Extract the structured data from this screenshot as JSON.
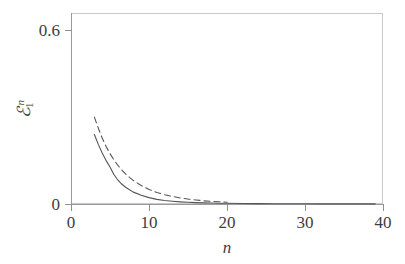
{
  "chart_data": {
    "type": "line",
    "title": "",
    "subtitle": "",
    "xlabel": "n",
    "ylabel": "E_1^n",
    "ylabel_parts": {
      "symbol": "ℰ",
      "subscript": "1",
      "superscript": "n"
    },
    "xlim": [
      0,
      40
    ],
    "ylim": [
      0,
      0.66
    ],
    "xticks": [
      0,
      10,
      20,
      30,
      40
    ],
    "xticklabels": [
      "0",
      "10",
      "20",
      "30",
      "40"
    ],
    "yticks": [
      0,
      0.6
    ],
    "yticklabels": [
      "0",
      "0.6"
    ],
    "grid": false,
    "legend": "none",
    "frame": "box",
    "series": [
      {
        "name": "dashed-curve",
        "style": "dashed",
        "color": "#555555",
        "x": [
          3,
          3.5,
          4,
          4.5,
          5,
          5.5,
          6,
          6.5,
          7,
          7.5,
          8,
          9,
          10,
          11,
          12,
          13,
          14,
          15,
          16,
          17,
          18,
          19,
          20
        ],
        "y": [
          0.3,
          0.262,
          0.228,
          0.199,
          0.174,
          0.153,
          0.134,
          0.118,
          0.104,
          0.092,
          0.081,
          0.064,
          0.05,
          0.04,
          0.032,
          0.026,
          0.021,
          0.017,
          0.014,
          0.011,
          0.009,
          0.008,
          0.006
        ]
      },
      {
        "name": "solid-curve",
        "style": "solid",
        "color": "#555555",
        "x": [
          3,
          3.5,
          4,
          4.5,
          5,
          5.5,
          6,
          6.5,
          7,
          7.5,
          8,
          9,
          10,
          11,
          12,
          13,
          14,
          15,
          16,
          17,
          18,
          19,
          20,
          22,
          24,
          26,
          28,
          30,
          32,
          34,
          36,
          38,
          39
        ],
        "y": [
          0.24,
          0.206,
          0.176,
          0.15,
          0.128,
          0.102,
          0.083,
          0.069,
          0.058,
          0.049,
          0.041,
          0.03,
          0.022,
          0.016,
          0.012,
          0.0095,
          0.0075,
          0.006,
          0.0048,
          0.004,
          0.0033,
          0.0028,
          0.0024,
          0.0018,
          0.0014,
          0.0011,
          0.0009,
          0.0007,
          0.0006,
          0.0005,
          0.0004,
          0.0003,
          0.0003
        ]
      }
    ],
    "annotations": []
  },
  "axes": {
    "y_ticks": [
      {
        "label": "0.6",
        "value": 0.6
      },
      {
        "label": "0",
        "value": 0
      }
    ],
    "x_ticks": [
      {
        "label": "0",
        "value": 0
      },
      {
        "label": "10",
        "value": 10
      },
      {
        "label": "20",
        "value": 20
      },
      {
        "label": "30",
        "value": 30
      },
      {
        "label": "40",
        "value": 40
      }
    ],
    "x_title": "n",
    "y_title_symbol": "ℰ",
    "y_title_sub": "1",
    "y_title_sup": "n"
  },
  "colors": {
    "frame": "#c9c9c9",
    "axis": "#9a9a9a",
    "curve": "#555555",
    "text": "#3d3d3d",
    "background": "#ffffff"
  }
}
